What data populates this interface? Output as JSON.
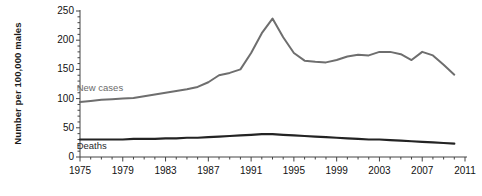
{
  "chart_data": {
    "type": "line",
    "title": "",
    "xlabel": "",
    "ylabel": "Number per 100,000 males",
    "xlim": [
      1975,
      2011
    ],
    "ylim": [
      0,
      250
    ],
    "grid": false,
    "legend_position": "inline-labels",
    "x_ticks": [
      1975,
      1979,
      1983,
      1987,
      1991,
      1995,
      1999,
      2003,
      2007,
      2011
    ],
    "y_ticks": [
      0,
      50,
      100,
      150,
      200,
      250
    ],
    "y_minor_tick_step": 10,
    "x_minor_tick_step": 1,
    "x": [
      1975,
      1976,
      1977,
      1978,
      1979,
      1980,
      1981,
      1982,
      1983,
      1984,
      1985,
      1986,
      1987,
      1988,
      1989,
      1990,
      1991,
      1992,
      1993,
      1994,
      1995,
      1996,
      1997,
      1998,
      1999,
      2000,
      2001,
      2002,
      2003,
      2004,
      2005,
      2006,
      2007,
      2008,
      2009,
      2010
    ],
    "series": [
      {
        "name": "New cases",
        "color": "#6e6e6e",
        "label_x": 1976,
        "label_y": 118,
        "values": [
          94,
          96,
          98,
          99,
          100,
          101,
          104,
          107,
          110,
          113,
          116,
          120,
          128,
          140,
          144,
          150,
          178,
          212,
          237,
          205,
          178,
          165,
          163,
          162,
          166,
          172,
          175,
          174,
          180,
          180,
          176,
          166,
          180,
          174,
          158,
          141
        ]
      },
      {
        "name": "Deaths",
        "color": "#232323",
        "label_x": 1976,
        "label_y": 18,
        "values": [
          30,
          30,
          30,
          30,
          30,
          31,
          31,
          31,
          32,
          32,
          33,
          33,
          34,
          35,
          36,
          37,
          38,
          39,
          39,
          38,
          37,
          36,
          35,
          34,
          33,
          32,
          31,
          30,
          30,
          29,
          28,
          27,
          26,
          25,
          24,
          23
        ]
      }
    ],
    "annotations": []
  },
  "labels": {
    "y_axis_title": "Number per 100,000 males",
    "series_new_cases": "New cases",
    "series_deaths": "Deaths"
  }
}
